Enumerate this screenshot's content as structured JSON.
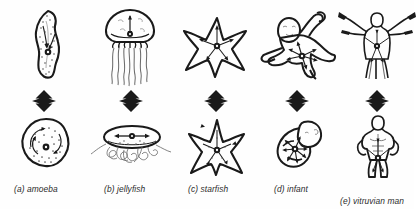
{
  "figure": {
    "background_color": "#fefefe",
    "ink_color": "#1a1a1a",
    "caption_color": "#2b2b2b",
    "rows": 2,
    "columns": 5,
    "relation_symbol": "double-headed-vertical-arrow"
  },
  "items": [
    {
      "key": "amoeba",
      "label": "(a) amoeba",
      "letter": "(a)",
      "name": "amoeba",
      "top_form": "elongated amoeba with internal granules and axial arrows",
      "bottom_form": "rounded amoeba with circular rotational arrows",
      "arrow_icon": "double-arrow-vertical"
    },
    {
      "key": "jellyfish",
      "label": "(b) jellyfish",
      "letter": "(b)",
      "name": "jellyfish",
      "top_form": "bell-shaped medusa with hanging tentacles and vertical arrow",
      "bottom_form": "flattened bell with splayed tentacles and horizontal arrows",
      "arrow_icon": "double-arrow-vertical"
    },
    {
      "key": "starfish",
      "label": "(c) starfish",
      "letter": "(c)",
      "name": "starfish",
      "top_form": "five-armed sea star with radial arrows",
      "bottom_form": "five-armed sea star with radial arrows, upright",
      "arrow_icon": "double-arrow-vertical"
    },
    {
      "key": "infant",
      "label": "(d) infant",
      "letter": "(d)",
      "name": "infant",
      "top_form": "infant with limbs extended and radial arrows from centre",
      "bottom_form": "curled foetus with radial arrows from centre",
      "arrow_icon": "double-arrow-vertical"
    },
    {
      "key": "vitruvian-man",
      "label": "(e) vitruvian man",
      "letter": "(e)",
      "name": "vitruvian man",
      "top_form": "figure with arms outstretched, Vitruvian pose",
      "bottom_form": "muscular standing figure, arms at sides",
      "arrow_icon": "double-arrow-vertical"
    }
  ]
}
